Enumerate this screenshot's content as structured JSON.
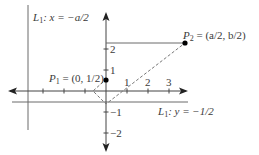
{
  "diagram": {
    "colors": {
      "axis": "#444444",
      "line": "#6a6a6a",
      "dashed": "#777777",
      "point": "#000000",
      "text": "#3a3a3a"
    },
    "labels": {
      "vertical_line": {
        "name": "L",
        "sub": "1",
        "eq": ": x = −a/2"
      },
      "horizontal_line": {
        "name": "L",
        "sub": "1",
        "eq": ": y = −1/2"
      },
      "p1": {
        "name": "P",
        "sub": "1",
        "eq": " = (0, 1/2)"
      },
      "p2": {
        "name": "P",
        "sub": "2",
        "eq": " = (a/2, b/2)"
      }
    },
    "x_ticks": [
      "1",
      "2",
      "3"
    ],
    "y_ticks": [
      "2",
      "1",
      "−1",
      "−2"
    ]
  }
}
